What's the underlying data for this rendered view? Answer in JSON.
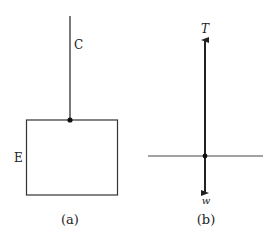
{
  "figure_a": {
    "cord_label": "C",
    "body_label": "E",
    "caption": "(a)"
  },
  "figure_b": {
    "tension_label": "T",
    "weight_label": "w",
    "caption": "(b)"
  },
  "colors": {
    "line": "#333333",
    "background": "#ffffff"
  }
}
